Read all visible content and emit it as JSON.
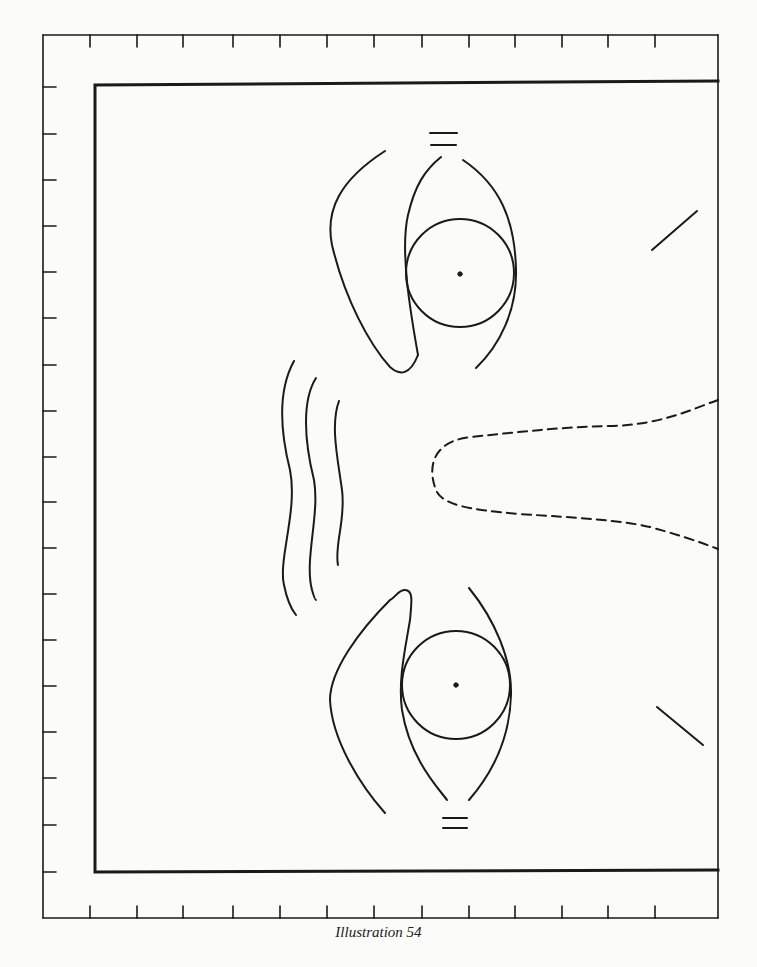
{
  "figure": {
    "caption": "Illustration 54",
    "stroke_color": "#1a1a1a",
    "background_color": "#fbfbfa"
  },
  "frame": {
    "outer": {
      "x1": 43,
      "y1": 35,
      "x2": 718,
      "y2": 918
    },
    "inner": {
      "x1": 95,
      "y1": 84,
      "x2": 718,
      "y2": 872
    },
    "top_ticks_x": [
      90,
      137,
      183,
      233,
      280,
      327,
      374,
      422,
      469,
      515,
      562,
      608,
      655
    ],
    "left_ticks_y": [
      87,
      134,
      180,
      226,
      272,
      318,
      365,
      411,
      457,
      502,
      548,
      594,
      640,
      686,
      732,
      778,
      825,
      872
    ]
  },
  "elements": {
    "upper_eye": {
      "iris_center": [
        460,
        273
      ],
      "iris_radius": 54,
      "pupil_radius": 2
    },
    "lower_eye": {
      "iris_center": [
        456,
        685
      ],
      "iris_radius": 54,
      "pupil_radius": 2
    },
    "wrinkles": 3,
    "dashed_contour": "tapering open shape extending to right edge",
    "diagonal_marks": 2
  }
}
